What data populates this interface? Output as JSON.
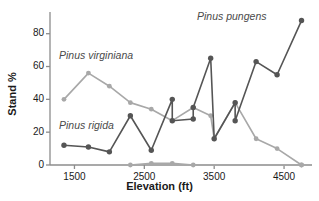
{
  "chart_data": {
    "type": "line",
    "title": "",
    "xlabel": "Elevation (ft)",
    "ylabel": "Stand %",
    "xlim": [
      1150,
      4900
    ],
    "ylim": [
      0,
      92
    ],
    "xticks": [
      1500,
      2500,
      3500,
      4500
    ],
    "yticks": [
      0,
      20,
      40,
      60,
      80
    ],
    "grid": false,
    "legend_position": "inline-annotations",
    "annotations": [
      {
        "text": "Pinus pungens",
        "series": "Pinus pungens"
      },
      {
        "text": "Pinus virginiana",
        "series": "Pinus virginiana"
      },
      {
        "text": "Pinus rigida",
        "series": "Pinus rigida"
      }
    ],
    "series": [
      {
        "name": "Pinus pungens",
        "color": "#555555",
        "points": [
          {
            "x": 1350,
            "y": 12
          },
          {
            "x": 1700,
            "y": 11
          },
          {
            "x": 2000,
            "y": 8
          },
          {
            "x": 2300,
            "y": 30
          },
          {
            "x": 2600,
            "y": 9
          },
          {
            "x": 2900,
            "y": 40
          },
          {
            "x": 2900,
            "y": 27
          },
          {
            "x": 3200,
            "y": 28
          },
          {
            "x": 3200,
            "y": 35
          },
          {
            "x": 3450,
            "y": 65
          },
          {
            "x": 3500,
            "y": 16
          },
          {
            "x": 3800,
            "y": 38
          },
          {
            "x": 3800,
            "y": 27
          },
          {
            "x": 4100,
            "y": 63
          },
          {
            "x": 4400,
            "y": 55
          },
          {
            "x": 4750,
            "y": 88
          }
        ]
      },
      {
        "name": "Pinus virginiana",
        "color": "#a8a8a8",
        "points": [
          {
            "x": 1350,
            "y": 40
          },
          {
            "x": 1700,
            "y": 56
          },
          {
            "x": 2000,
            "y": 48
          },
          {
            "x": 2300,
            "y": 38
          },
          {
            "x": 2600,
            "y": 34
          },
          {
            "x": 2900,
            "y": 27
          },
          {
            "x": 3200,
            "y": 35
          },
          {
            "x": 3450,
            "y": 30
          },
          {
            "x": 3500,
            "y": 16
          },
          {
            "x": 3800,
            "y": 38
          },
          {
            "x": 4100,
            "y": 16
          },
          {
            "x": 4400,
            "y": 10
          },
          {
            "x": 4750,
            "y": 0
          }
        ]
      },
      {
        "name": "Pinus rigida",
        "color": "#a8a8a8",
        "points": [
          {
            "x": 2300,
            "y": 0
          },
          {
            "x": 2600,
            "y": 1
          },
          {
            "x": 2900,
            "y": 1
          },
          {
            "x": 3200,
            "y": 0
          },
          {
            "x": 4750,
            "y": 0
          }
        ]
      }
    ]
  },
  "axes": {
    "ylabel": "Stand %",
    "xlabel": "Elevation (ft)",
    "ytick_labels": [
      "0",
      "20",
      "40",
      "60",
      "80"
    ],
    "xtick_labels": [
      "1500",
      "2500",
      "3500",
      "4500"
    ]
  },
  "labels": {
    "pungens": "Pinus pungens",
    "virginiana": "Pinus virginiana",
    "rigida": "Pinus rigida"
  }
}
